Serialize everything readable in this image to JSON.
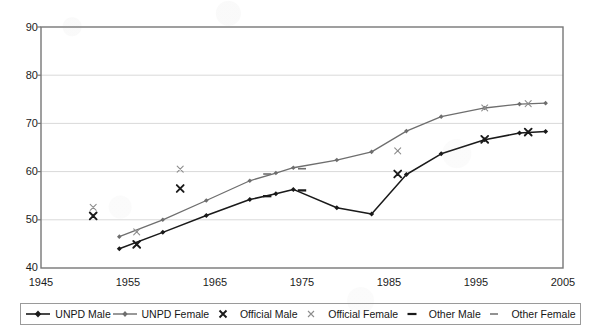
{
  "chart_data": {
    "type": "line",
    "title": "",
    "xlabel": "",
    "ylabel": "",
    "xlim": [
      1945,
      2005
    ],
    "ylim": [
      40,
      90
    ],
    "xticks": [
      "1945",
      "1955",
      "1965",
      "1975",
      "1985",
      "1995",
      "2005"
    ],
    "yticks": [
      "40",
      "50",
      "60",
      "70",
      "80",
      "90"
    ],
    "grid": true,
    "legend_position": "bottom",
    "series": [
      {
        "name": "UNPD Male",
        "style": "line-marker",
        "marker": "diamond",
        "color": "#1a1a1a",
        "points": [
          [
            1954,
            44.0
          ],
          [
            1959,
            47.4
          ],
          [
            1964,
            50.9
          ],
          [
            1969,
            54.2
          ],
          [
            1972,
            55.4
          ],
          [
            1974,
            56.3
          ],
          [
            1979,
            52.5
          ],
          [
            1983,
            51.2
          ],
          [
            1987,
            59.4
          ],
          [
            1991,
            63.7
          ],
          [
            1996,
            66.6
          ],
          [
            2000,
            68.0
          ],
          [
            2003,
            68.3
          ]
        ]
      },
      {
        "name": "UNPD Female",
        "style": "line-marker",
        "marker": "diamond",
        "color": "#6e6e6e",
        "points": [
          [
            1954,
            46.5
          ],
          [
            1959,
            50.0
          ],
          [
            1964,
            54.0
          ],
          [
            1969,
            58.1
          ],
          [
            1972,
            59.7
          ],
          [
            1974,
            60.8
          ],
          [
            1979,
            62.4
          ],
          [
            1983,
            64.1
          ],
          [
            1987,
            68.4
          ],
          [
            1991,
            71.4
          ],
          [
            1996,
            73.2
          ],
          [
            2000,
            74.0
          ],
          [
            2003,
            74.2
          ]
        ]
      },
      {
        "name": "Official Male",
        "style": "marker-only",
        "marker": "x-bold",
        "color": "#1a1a1a",
        "points": [
          [
            1951,
            50.8
          ],
          [
            1956,
            44.9
          ],
          [
            1961,
            56.5
          ],
          [
            1986,
            59.5
          ],
          [
            1996,
            66.7
          ],
          [
            2001,
            68.2
          ]
        ]
      },
      {
        "name": "Official Female",
        "style": "marker-only",
        "marker": "x-light",
        "color": "#8d8d8d",
        "points": [
          [
            1951,
            52.6
          ],
          [
            1956,
            47.5
          ],
          [
            1961,
            60.5
          ],
          [
            1986,
            64.3
          ],
          [
            1996,
            73.2
          ],
          [
            2001,
            74.1
          ]
        ]
      },
      {
        "name": "Other Male",
        "style": "marker-only",
        "marker": "dash-bold",
        "color": "#1a1a1a",
        "points": [
          [
            1971,
            54.9
          ],
          [
            1975,
            56.1
          ]
        ]
      },
      {
        "name": "Other Female",
        "style": "marker-only",
        "marker": "dash-light",
        "color": "#6e6e6e",
        "points": [
          [
            1971,
            59.5
          ],
          [
            1975,
            60.6
          ]
        ]
      }
    ]
  },
  "axis": {
    "y_labels": [
      "90",
      "80",
      "70",
      "60",
      "50",
      "40"
    ],
    "x_labels": [
      "1945",
      "1955",
      "1965",
      "1975",
      "1985",
      "1995",
      "2005"
    ]
  },
  "legend": {
    "items": [
      {
        "label": "UNPD Male",
        "key": "line-diamond-dark",
        "color": "#1a1a1a"
      },
      {
        "label": "UNPD Female",
        "key": "line-diamond-gray",
        "color": "#6e6e6e"
      },
      {
        "label": "Official Male",
        "key": "x-bold",
        "color": "#1a1a1a"
      },
      {
        "label": "Official Female",
        "key": "x-light",
        "color": "#8d8d8d"
      },
      {
        "label": "Other Male",
        "key": "dash-bold",
        "color": "#1a1a1a"
      },
      {
        "label": "Other Female",
        "key": "dash-light",
        "color": "#6e6e6e"
      }
    ]
  },
  "colors": {
    "plot_border": "#777777",
    "gridline": "#d9d9d9",
    "text": "#1c1c1c",
    "background": "#ffffff"
  }
}
